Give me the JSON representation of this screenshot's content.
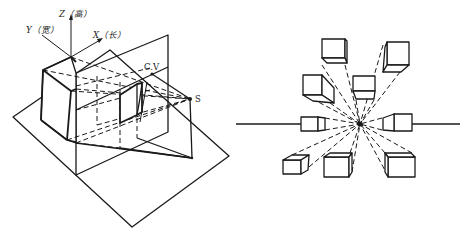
{
  "figure_left": {
    "title": "Perspective projection setup",
    "axes": {
      "z_label": "Z（高）",
      "y_label": "Y（宽）",
      "x_label": "X（长）"
    },
    "points": {
      "center_of_vision": "C.V",
      "station_point": "S"
    }
  },
  "figure_right": {
    "title": "One-point perspective cubes converging to vanishing point",
    "cube_count": 8,
    "horizon_line": true
  },
  "colors": {
    "line": "#1a1a1a",
    "background": "#ffffff"
  }
}
